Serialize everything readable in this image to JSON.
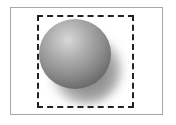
{
  "canvas": {
    "frame_border_color": "#a8a8a8",
    "selection_border_color": "#222222",
    "selection_style": "dashed"
  },
  "object": {
    "shape": "sphere",
    "highlight_color": "#d8d8d8",
    "base_color": "#8c8c8c",
    "shadow": "drop-shadow-bottom-right"
  }
}
